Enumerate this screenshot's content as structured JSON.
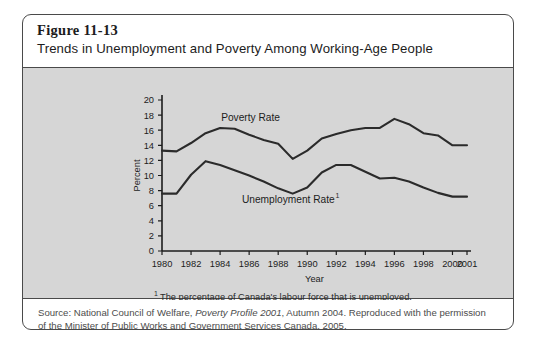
{
  "figure": {
    "number": "Figure 11-13",
    "title": "Trends in Unemployment and Poverty Among Working-Age People"
  },
  "footnote": {
    "marker": "1",
    "text": "The percentage of Canada's labour force that is unemployed."
  },
  "source": {
    "line1_a": "Source: National Council of Welfare, ",
    "line1_italic": "Poverty Profile 2001",
    "line1_b": ", Autumn 2004. Reproduced with the permission",
    "line2": "of the Minister of Public Works and Government Services Canada, 2005."
  },
  "colors": {
    "panel_background": "#d6d6d6",
    "page_background": "#ffffff",
    "line": "#2b2b2b",
    "axis": "#1c1c1c",
    "border": "#4a4a4a",
    "text": "#1c1c1c",
    "source_text": "#4c4c4c"
  },
  "chart_data": {
    "type": "line",
    "title": "Trends in Unemployment and Poverty Among Working-Age People",
    "xlabel": "Year",
    "ylabel": "Percent",
    "xlim": [
      1980,
      2001
    ],
    "ylim": [
      0,
      20
    ],
    "ytick_step": 2,
    "yticks": [
      0,
      2,
      4,
      6,
      8,
      10,
      12,
      14,
      16,
      18,
      20
    ],
    "xticks": [
      1980,
      1982,
      1984,
      1986,
      1988,
      1990,
      1992,
      1994,
      1996,
      1998,
      2000,
      2001
    ],
    "xtick_labels": [
      "1980",
      "1982",
      "1984",
      "1986",
      "1988",
      "1990",
      "1992",
      "1994",
      "1996",
      "1998",
      "2000",
      "2001"
    ],
    "ytick_labels": [
      "0",
      "2",
      "4",
      "6",
      "8",
      "10",
      "12",
      "14",
      "16",
      "18",
      "20"
    ],
    "grid": false,
    "legend": "inline-annotations",
    "x": [
      1980,
      1981,
      1982,
      1983,
      1984,
      1985,
      1986,
      1987,
      1988,
      1989,
      1990,
      1991,
      1992,
      1993,
      1994,
      1995,
      1996,
      1997,
      1998,
      1999,
      2000,
      2001
    ],
    "series": [
      {
        "name": "Poverty Rate",
        "label": "Poverty Rate",
        "values": [
          13.3,
          13.2,
          14.3,
          15.6,
          16.3,
          16.2,
          15.4,
          14.7,
          14.2,
          12.2,
          13.3,
          14.9,
          15.5,
          16.0,
          16.3,
          16.3,
          17.5,
          16.8,
          15.6,
          15.3,
          14.0,
          14.0
        ]
      },
      {
        "name": "Unemployment Rate",
        "label": "Unemployment Rate",
        "label_footnote": "1",
        "values": [
          7.6,
          7.6,
          10.1,
          11.9,
          11.4,
          10.7,
          10.0,
          9.2,
          8.3,
          7.6,
          8.4,
          10.4,
          11.4,
          11.4,
          10.5,
          9.6,
          9.7,
          9.2,
          8.4,
          7.7,
          7.2,
          7.2
        ]
      }
    ],
    "annotations": [
      {
        "text": "Poverty Rate",
        "x": 1986.1,
        "y": 17.2
      },
      {
        "text": "Unemployment Rate",
        "x": 1988.7,
        "y": 6.4
      }
    ]
  }
}
